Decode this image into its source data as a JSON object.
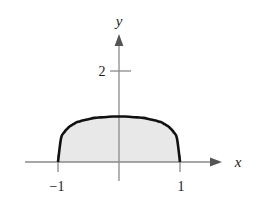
{
  "figure": {
    "background_color": "#ffffff",
    "axis_color": "#8a8a8a",
    "curve_color": "#111111",
    "fill_color": "#e8e8e8",
    "label_color": "#1a1a1a"
  },
  "axes": {
    "x_label": "x",
    "y_label": "y",
    "x_tick_labels": [
      "−1",
      "1"
    ],
    "y_tick_labels": [
      "2"
    ]
  },
  "chart_data": {
    "type": "area",
    "title": "",
    "subtitle": "",
    "xlabel": "x",
    "ylabel": "y",
    "xlim": [
      -1.45,
      1.45
    ],
    "ylim": [
      -0.4,
      2.85
    ],
    "grid": false,
    "legend": null,
    "annotations": [],
    "x_ticks": [
      -1,
      1
    ],
    "x_tick_labels": [
      "−1",
      "1"
    ],
    "y_ticks": [
      2
    ],
    "y_tick_labels": [
      "2"
    ],
    "series": [
      {
        "name": "curve",
        "description": "flat-topped even curve on [-1, 1], peak y = 1 at x = 0, dropping steeply to y = 0 at x = ±1",
        "fill": true,
        "fill_to": 0,
        "x": [
          -1.0,
          -0.95,
          -0.9,
          -0.85,
          -0.8,
          -0.75,
          -0.7,
          -0.65,
          -0.6,
          -0.5,
          -0.4,
          -0.3,
          -0.2,
          -0.1,
          0.0,
          0.1,
          0.2,
          0.3,
          0.4,
          0.5,
          0.6,
          0.65,
          0.7,
          0.75,
          0.8,
          0.85,
          0.9,
          0.95,
          1.0
        ],
        "y": [
          0.0,
          0.52,
          0.65,
          0.73,
          0.79,
          0.83,
          0.87,
          0.89,
          0.91,
          0.94,
          0.97,
          0.98,
          0.99,
          1.0,
          1.0,
          1.0,
          0.99,
          0.98,
          0.97,
          0.94,
          0.91,
          0.89,
          0.87,
          0.83,
          0.79,
          0.73,
          0.65,
          0.52,
          0.0
        ]
      }
    ]
  }
}
